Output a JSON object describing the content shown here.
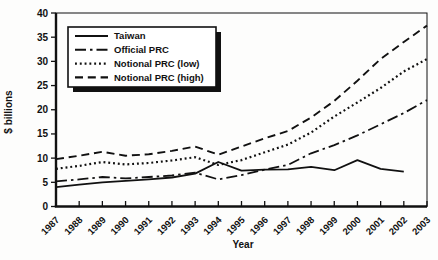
{
  "figure": {
    "background": "#fdfdfc",
    "line_color": "#111111",
    "legend_border_color": "#111111",
    "legend_shadow_color": "#111111",
    "legend_fill": "#ffffff"
  },
  "chart_data": {
    "type": "line",
    "title": "",
    "xlabel": "Year",
    "ylabel": "$ billions",
    "ylim": [
      0,
      40
    ],
    "ytick_step": 5,
    "grid": false,
    "legend_position": "top-left",
    "categories": [
      "1987",
      "1988",
      "1989",
      "1990",
      "1991",
      "1992",
      "1993",
      "1994",
      "1995",
      "1996",
      "1997",
      "1998",
      "1999",
      "2000",
      "2001",
      "2002",
      "2003"
    ],
    "series": [
      {
        "name": "Taiwan",
        "dash": "solid",
        "values": [
          4.0,
          4.5,
          5.0,
          5.3,
          5.6,
          6.0,
          6.8,
          9.2,
          7.4,
          7.6,
          7.7,
          8.2,
          7.5,
          9.6,
          7.8,
          7.2,
          null
        ]
      },
      {
        "name": "Official PRC",
        "dash": "dashdot",
        "values": [
          5.2,
          5.6,
          6.1,
          5.8,
          6.1,
          6.4,
          7.0,
          5.6,
          6.5,
          7.6,
          8.6,
          11.0,
          12.7,
          14.7,
          17.0,
          19.3,
          22.0
        ]
      },
      {
        "name": "Notional PRC (low)",
        "dash": "dotted",
        "values": [
          7.8,
          8.4,
          9.2,
          8.7,
          9.0,
          9.5,
          10.2,
          8.6,
          9.6,
          11.2,
          12.8,
          15.3,
          18.6,
          21.5,
          24.5,
          27.9,
          30.5
        ]
      },
      {
        "name": "Notional PRC (high)",
        "dash": "dashed",
        "values": [
          9.8,
          10.5,
          11.3,
          10.5,
          10.8,
          11.5,
          12.4,
          10.7,
          12.4,
          14.1,
          15.6,
          18.4,
          21.8,
          26.0,
          30.5,
          34.0,
          37.4
        ]
      }
    ]
  }
}
